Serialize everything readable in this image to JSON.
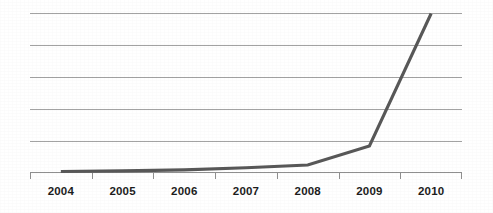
{
  "chart_data": {
    "type": "line",
    "title": "",
    "subtitle": "",
    "xlabel": "",
    "ylabel": "",
    "categories": [
      "2004",
      "2005",
      "2006",
      "2007",
      "2008",
      "2009",
      "2010"
    ],
    "series": [
      {
        "name": "",
        "values": [
          0.2,
          0.3,
          0.5,
          0.9,
          1.4,
          5.0,
          30.0
        ]
      }
    ],
    "ylim": [
      0,
      30
    ],
    "gridlines": {
      "horizontal": true,
      "vertical": false,
      "count": 6,
      "levels": [
        5,
        10,
        15,
        20,
        25,
        30
      ]
    },
    "legend": {
      "visible": false,
      "position": "none"
    },
    "axis": {
      "y_tick_labels_visible": false,
      "x_tick_labels_visible": true,
      "x_axis_line_visible": true,
      "x_tick_marks": 8
    },
    "annotations": [],
    "colors": {
      "series_line": "#585858",
      "gridline": "#a3a3a3",
      "axis_line": "#8f8f8f",
      "label_text": "#1d1d1d",
      "background": "#ffffff"
    }
  }
}
